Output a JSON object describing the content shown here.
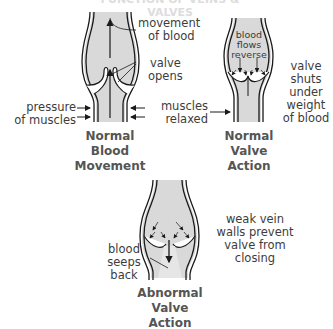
{
  "title_cut": "FUNCTION OF VEINS & VALVES",
  "panels": {
    "normal_blood": {
      "caption": [
        "Normal",
        "Blood",
        "Movement"
      ],
      "labels": {
        "movement": [
          "movement",
          "of blood"
        ],
        "valve_opens": [
          "valve",
          "opens"
        ],
        "pressure": [
          "pressure",
          "of muscles"
        ],
        "relaxed": [
          "muscles",
          "relaxed"
        ]
      }
    },
    "normal_valve": {
      "caption": [
        "Normal",
        "Valve",
        "Action"
      ],
      "inside": [
        "blood",
        "flows",
        "reverse"
      ],
      "labels": {
        "shuts": [
          "valve",
          "shuts",
          "under",
          "weight",
          "of blood"
        ]
      }
    },
    "abnormal_valve": {
      "caption": [
        "Abnormal",
        "Valve",
        "Action"
      ],
      "labels": {
        "seeps": [
          "blood",
          "seeps",
          "back"
        ],
        "weak": [
          "weak vein",
          "walls prevent",
          "valve from",
          "closing"
        ]
      }
    }
  },
  "colors": {
    "blood_fill": "#d9d9d9",
    "line": "#1a1a1a",
    "caption": "#555555",
    "text": "#3c3c3c"
  }
}
